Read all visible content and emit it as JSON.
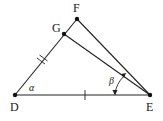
{
  "diagram": {
    "type": "geometry-triangle",
    "colors": {
      "line": "#222222",
      "point": "#111111",
      "background": "#ffffff"
    },
    "points": [
      {
        "id": "D",
        "label": "D",
        "x": 15,
        "y": 95
      },
      {
        "id": "E",
        "label": "E",
        "x": 150,
        "y": 95
      },
      {
        "id": "F",
        "label": "F",
        "x": 77,
        "y": 19
      },
      {
        "id": "G",
        "label": "G",
        "x": 64,
        "y": 34
      }
    ],
    "segments": [
      {
        "from": "D",
        "to": "E"
      },
      {
        "from": "D",
        "to": "F"
      },
      {
        "from": "F",
        "to": "E"
      },
      {
        "from": "G",
        "to": "E"
      }
    ],
    "tick_marks": [
      {
        "segment": "D-G",
        "count": 2
      },
      {
        "segment": "D-E",
        "count": 1
      }
    ],
    "angles": [
      {
        "label": "α",
        "vertex": "D",
        "between": [
          "E",
          "F"
        ]
      },
      {
        "label": "β",
        "vertex": "E",
        "between": [
          "G",
          "D"
        ],
        "arrow": true
      }
    ]
  }
}
